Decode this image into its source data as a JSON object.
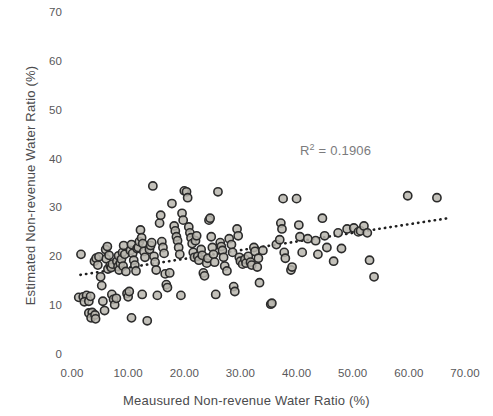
{
  "chart_data": {
    "type": "scatter",
    "title": "",
    "xlabel": "Meausured Non-revenue Water Ratio (%)",
    "ylabel": "Estimated Non-revenue Water Ratio (%)",
    "xlim": [
      0,
      70
    ],
    "ylim": [
      0,
      70
    ],
    "grid": false,
    "legend": null,
    "xticks": [
      "0.00",
      "10.00",
      "20.00",
      "30.00",
      "40.00",
      "50.00",
      "60.00",
      "70.00"
    ],
    "xtick_values": [
      0,
      10,
      20,
      30,
      40,
      50,
      60,
      70
    ],
    "yticks": [
      "0",
      "10",
      "20",
      "30",
      "40",
      "50",
      "60",
      "70"
    ],
    "ytick_values": [
      0,
      10,
      20,
      30,
      40,
      50,
      60,
      70
    ],
    "annotations": [
      {
        "name": "r-squared",
        "text_prefix": "R",
        "text_sup": "2",
        "text_suffix": " = 0.1906",
        "full_text": "R² = 0.1906",
        "value": 0.1906,
        "x": 41.0,
        "y": 43.0
      }
    ],
    "trendline": {
      "type": "linear",
      "style": "dotted",
      "color": "#1f1f1f",
      "x_start": 1.5,
      "y_start": 16.4,
      "x_end": 67.0,
      "y_end": 28.0
    },
    "marker_style": {
      "shape": "circle",
      "fill": "#b9b6ae",
      "stroke": "#2b2b2b",
      "radius_px": 4.1,
      "stroke_width_px": 1.6
    },
    "series": [
      {
        "name": "Water utilities",
        "points": [
          [
            1.6,
            20.6
          ],
          [
            1.2,
            11.8
          ],
          [
            2.0,
            11.9
          ],
          [
            2.6,
            12.2
          ],
          [
            2.2,
            10.9
          ],
          [
            3.0,
            11.0
          ],
          [
            3.3,
            12.0
          ],
          [
            3.0,
            8.6
          ],
          [
            3.6,
            8.7
          ],
          [
            3.4,
            7.6
          ],
          [
            4.1,
            8.2
          ],
          [
            4.2,
            7.4
          ],
          [
            4.0,
            19.2
          ],
          [
            4.3,
            19.8
          ],
          [
            4.6,
            18.4
          ],
          [
            4.8,
            20.1
          ],
          [
            5.1,
            16.0
          ],
          [
            5.3,
            14.2
          ],
          [
            5.5,
            11.0
          ],
          [
            5.8,
            9.1
          ],
          [
            6.0,
            21.6
          ],
          [
            6.3,
            22.2
          ],
          [
            6.1,
            19.7
          ],
          [
            6.6,
            20.4
          ],
          [
            6.4,
            17.6
          ],
          [
            6.8,
            18.3
          ],
          [
            7.0,
            17.9
          ],
          [
            7.2,
            18.6
          ],
          [
            7.1,
            12.4
          ],
          [
            7.4,
            11.4
          ],
          [
            7.6,
            10.3
          ],
          [
            7.9,
            11.6
          ],
          [
            8.0,
            19.2
          ],
          [
            8.2,
            18.1
          ],
          [
            8.4,
            17.4
          ],
          [
            8.6,
            18.8
          ],
          [
            8.3,
            20.3
          ],
          [
            8.8,
            19.6
          ],
          [
            9.0,
            21.0
          ],
          [
            9.2,
            22.4
          ],
          [
            9.4,
            20.6
          ],
          [
            9.1,
            18.2
          ],
          [
            9.6,
            17.1
          ],
          [
            9.8,
            12.6
          ],
          [
            10.0,
            11.9
          ],
          [
            10.2,
            13.0
          ],
          [
            10.4,
            21.4
          ],
          [
            10.6,
            22.6
          ],
          [
            10.8,
            20.8
          ],
          [
            11.0,
            19.4
          ],
          [
            11.2,
            18.4
          ],
          [
            11.4,
            17.2
          ],
          [
            11.6,
            21.8
          ],
          [
            11.8,
            22.0
          ],
          [
            12.0,
            23.2
          ],
          [
            12.2,
            25.6
          ],
          [
            12.4,
            24.0
          ],
          [
            12.6,
            22.8
          ],
          [
            12.8,
            21.2
          ],
          [
            13.0,
            20.0
          ],
          [
            12.5,
            12.4
          ],
          [
            13.4,
            7.0
          ],
          [
            10.6,
            7.6
          ],
          [
            13.8,
            21.6
          ],
          [
            14.0,
            22.4
          ],
          [
            14.2,
            23.0
          ],
          [
            14.4,
            34.6
          ],
          [
            14.6,
            20.2
          ],
          [
            14.8,
            19.0
          ],
          [
            15.0,
            17.4
          ],
          [
            15.2,
            12.2
          ],
          [
            15.6,
            27.0
          ],
          [
            15.8,
            28.6
          ],
          [
            16.0,
            23.2
          ],
          [
            16.2,
            22.0
          ],
          [
            16.4,
            20.8
          ],
          [
            16.6,
            16.6
          ],
          [
            16.8,
            14.4
          ],
          [
            17.0,
            13.8
          ],
          [
            17.4,
            16.8
          ],
          [
            17.8,
            31.0
          ],
          [
            18.2,
            26.4
          ],
          [
            18.4,
            25.4
          ],
          [
            18.6,
            24.2
          ],
          [
            18.8,
            23.4
          ],
          [
            19.0,
            22.0
          ],
          [
            19.2,
            20.6
          ],
          [
            19.4,
            12.2
          ],
          [
            19.6,
            29.0
          ],
          [
            19.8,
            27.6
          ],
          [
            20.0,
            33.6
          ],
          [
            20.4,
            33.4
          ],
          [
            20.6,
            32.2
          ],
          [
            20.8,
            26.2
          ],
          [
            21.0,
            25.0
          ],
          [
            21.2,
            24.0
          ],
          [
            21.4,
            22.8
          ],
          [
            21.6,
            21.0
          ],
          [
            21.8,
            20.0
          ],
          [
            22.0,
            23.4
          ],
          [
            22.2,
            24.4
          ],
          [
            22.4,
            20.2
          ],
          [
            22.6,
            19.4
          ],
          [
            23.0,
            21.6
          ],
          [
            23.2,
            20.4
          ],
          [
            23.4,
            16.8
          ],
          [
            23.6,
            16.2
          ],
          [
            24.0,
            18.8
          ],
          [
            24.2,
            19.8
          ],
          [
            24.4,
            27.6
          ],
          [
            24.6,
            28.0
          ],
          [
            24.8,
            24.2
          ],
          [
            25.0,
            22.0
          ],
          [
            25.2,
            20.6
          ],
          [
            25.4,
            19.0
          ],
          [
            25.6,
            12.4
          ],
          [
            26.0,
            33.4
          ],
          [
            26.4,
            23.0
          ],
          [
            26.6,
            22.2
          ],
          [
            26.8,
            21.4
          ],
          [
            27.0,
            20.0
          ],
          [
            27.2,
            18.2
          ],
          [
            27.6,
            17.2
          ],
          [
            28.0,
            23.8
          ],
          [
            28.4,
            22.6
          ],
          [
            28.6,
            21.0
          ],
          [
            28.8,
            14.0
          ],
          [
            29.0,
            13.0
          ],
          [
            29.4,
            25.8
          ],
          [
            29.6,
            24.4
          ],
          [
            29.8,
            20.0
          ],
          [
            30.0,
            19.2
          ],
          [
            30.4,
            18.6
          ],
          [
            30.8,
            19.6
          ],
          [
            31.0,
            18.8
          ],
          [
            31.4,
            20.2
          ],
          [
            31.8,
            19.0
          ],
          [
            32.0,
            18.4
          ],
          [
            32.4,
            22.0
          ],
          [
            32.6,
            21.2
          ],
          [
            33.0,
            18.0
          ],
          [
            33.2,
            19.8
          ],
          [
            33.4,
            14.8
          ],
          [
            34.0,
            21.4
          ],
          [
            35.4,
            10.4
          ],
          [
            35.6,
            10.6
          ],
          [
            36.4,
            22.6
          ],
          [
            37.0,
            23.6
          ],
          [
            37.2,
            27.0
          ],
          [
            37.4,
            25.8
          ],
          [
            37.6,
            32.0
          ],
          [
            37.8,
            21.0
          ],
          [
            38.0,
            19.8
          ],
          [
            39.0,
            17.4
          ],
          [
            39.2,
            18.0
          ],
          [
            40.0,
            32.0
          ],
          [
            40.4,
            26.6
          ],
          [
            40.6,
            24.2
          ],
          [
            41.0,
            21.0
          ],
          [
            42.0,
            23.8
          ],
          [
            43.4,
            23.4
          ],
          [
            43.8,
            20.6
          ],
          [
            44.6,
            28.0
          ],
          [
            45.0,
            24.4
          ],
          [
            45.4,
            22.0
          ],
          [
            46.6,
            19.2
          ],
          [
            47.4,
            25.0
          ],
          [
            48.0,
            21.8
          ],
          [
            49.0,
            25.8
          ],
          [
            50.2,
            26.0
          ],
          [
            51.0,
            25.2
          ],
          [
            51.4,
            25.4
          ],
          [
            52.0,
            26.4
          ],
          [
            52.6,
            25.0
          ],
          [
            53.0,
            19.4
          ],
          [
            53.8,
            16.0
          ],
          [
            59.8,
            32.6
          ],
          [
            65.0,
            32.2
          ]
        ]
      }
    ]
  },
  "axis_title_color": "#4b4b4d",
  "tick_label_color": "#58585a"
}
